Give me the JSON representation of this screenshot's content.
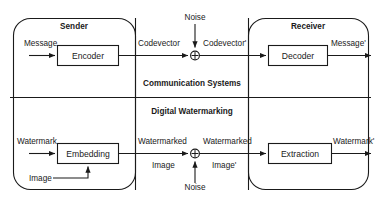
{
  "diagram": {
    "title_top": "Communication Systems",
    "title_bottom": "Digital Watermarking",
    "groups": {
      "sender": "Sender",
      "receiver": "Receiver"
    },
    "top_row": {
      "input_label": "Message",
      "process_a": "Encoder",
      "mid_label_left": "Codevector",
      "noise_label": "Noise",
      "mid_label_right": "Codevector'",
      "process_b": "Decoder",
      "output_label": "Message'",
      "adder_glyph": "plus-in-circle"
    },
    "bottom_row": {
      "input_label_primary": "Watermark",
      "input_label_secondary": "Image",
      "process_a": "Embedding",
      "mid_label_left_line1": "Watermarked",
      "mid_label_left_line2": "Image",
      "mid_label_right_line1": "Watermarked",
      "mid_label_right_line2": "Image'",
      "noise_label": "Noise",
      "process_b": "Extraction",
      "output_label": "Watermark'",
      "adder_glyph": "plus-in-circle"
    },
    "colors": {
      "stroke": "#1a1a1a",
      "text": "#1a1a1a",
      "background": "#ffffff"
    }
  }
}
